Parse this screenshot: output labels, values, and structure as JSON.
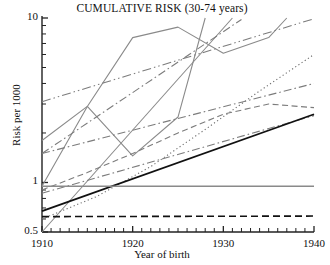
{
  "chart_data": {
    "type": "line",
    "title": "CUMULATIVE RISK (30-74 years)",
    "xlabel": "Year of birth",
    "ylabel": "Risk per 1000",
    "xlim": [
      1910,
      1940
    ],
    "ylim": [
      0.5,
      10
    ],
    "yscale": "log",
    "grid": false,
    "legend": "none",
    "xticks": [
      1910,
      1920,
      1930,
      1940
    ],
    "xtick_labels": [
      "1910",
      "1920",
      "1930",
      "1940"
    ],
    "xminor_step": 1,
    "yticks": [
      0.5,
      1,
      10
    ],
    "ytick_labels": [
      "0.5",
      "1",
      "10"
    ],
    "yminor_ticks": [
      0.6,
      0.7,
      0.8,
      0.9,
      2,
      3,
      4,
      5,
      6,
      7,
      8,
      9
    ],
    "colors": {
      "black": "#111111",
      "gray": "#808080",
      "midgray": "#6e6e6e",
      "axis": "#222222"
    },
    "series": [
      {
        "name": "jagged-cohort-trace",
        "style": "solid",
        "color": "#8a8a8a",
        "width": 1.1,
        "x": [
          1910,
          1915,
          1920,
          1925,
          1930,
          1935,
          1937
        ],
        "y": [
          0.95,
          2.9,
          7.6,
          8.8,
          6.1,
          7.6,
          10.0
        ]
      },
      {
        "name": "zigzag-dip-trace",
        "style": "solid",
        "color": "#8a8a8a",
        "width": 1.1,
        "x": [
          1910,
          1915,
          1920,
          1925,
          1928
        ],
        "y": [
          1.8,
          2.9,
          1.45,
          2.5,
          10.0
        ]
      },
      {
        "name": "steep-rise-line",
        "style": "solid",
        "color": "#8a8a8a",
        "width": 1.1,
        "x": [
          1910,
          1931
        ],
        "y": [
          0.5,
          10.0
        ]
      },
      {
        "name": "upper-dash-dot-dot",
        "style": "dash-dot-dot",
        "color": "#7c7c7c",
        "width": 1.1,
        "x": [
          1910,
          1940
        ],
        "y": [
          3.1,
          9.9
        ]
      },
      {
        "name": "mid-dash-dot-steep",
        "style": "dash-dot",
        "color": "#7c7c7c",
        "width": 1.1,
        "x": [
          1910,
          1932
        ],
        "y": [
          1.5,
          9.8
        ]
      },
      {
        "name": "dotted-accelerating",
        "style": "dotted",
        "color": "#6e6e6e",
        "width": 1.1,
        "x": [
          1910,
          1916,
          1922,
          1928,
          1934,
          1940
        ],
        "y": [
          0.6,
          0.82,
          1.25,
          2.1,
          3.6,
          6.0
        ]
      },
      {
        "name": "dash-dot-upper-mid",
        "style": "dash-dot",
        "color": "#7c7c7c",
        "width": 1.1,
        "x": [
          1910,
          1940
        ],
        "y": [
          1.5,
          4.0
        ]
      },
      {
        "name": "peaked-dashed-curve",
        "style": "dashed",
        "color": "#7c7c7c",
        "width": 1.1,
        "x": [
          1910,
          1915,
          1920,
          1925,
          1930,
          1935,
          1940
        ],
        "y": [
          0.9,
          1.15,
          1.5,
          2.0,
          2.6,
          3.0,
          2.85
        ]
      },
      {
        "name": "lower-dash-dot",
        "style": "dash-dot",
        "color": "#7c7c7c",
        "width": 1.1,
        "x": [
          1910,
          1940
        ],
        "y": [
          0.86,
          2.55
        ]
      },
      {
        "name": "black-solid-trend",
        "style": "solid",
        "color": "#111111",
        "width": 1.8,
        "x": [
          1910,
          1940
        ],
        "y": [
          0.67,
          2.6
        ]
      },
      {
        "name": "gray-flat-reference",
        "style": "solid",
        "color": "#8a8a8a",
        "width": 1.5,
        "x": [
          1910,
          1940
        ],
        "y": [
          0.95,
          0.95
        ]
      },
      {
        "name": "black-dashed-reference",
        "style": "dashed",
        "color": "#111111",
        "width": 1.6,
        "x": [
          1910,
          1940
        ],
        "y": [
          0.62,
          0.625
        ]
      }
    ]
  }
}
